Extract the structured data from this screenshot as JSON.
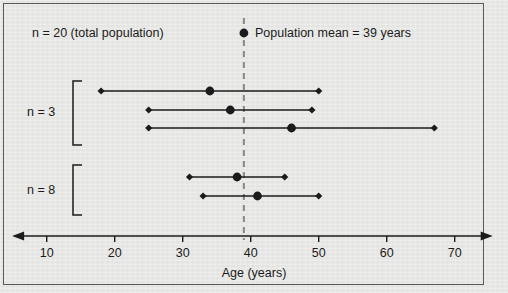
{
  "figure": {
    "background_color": "#e8e8e6",
    "border_color": "#5a5a58",
    "ink_color": "#1b1b1b",
    "mean_line_color": "#8c8c8c"
  },
  "legend": {
    "total_population_text": "n = 20 (total population)",
    "mean_marker_name": "population-mean-dot",
    "mean_text": "Population mean = 39 years"
  },
  "groups": [
    {
      "label": "n = 3",
      "bracket_top": 81,
      "bracket_bottom": 145
    },
    {
      "label": "n = 8",
      "bracket_top": 165,
      "bracket_bottom": 215
    }
  ],
  "chart_data": {
    "type": "scatter",
    "title": "",
    "subtitle": "",
    "xlabel": "Age (years)",
    "ylabel": "",
    "xlim": [
      5.5,
      75
    ],
    "xticks": [
      10,
      20,
      30,
      40,
      50,
      60,
      70
    ],
    "xticklabels": [
      "10",
      "20",
      "30",
      "40",
      "50",
      "60",
      "70"
    ],
    "grid": false,
    "legend_position": "top-right",
    "annotations": [
      "n = 20 (total population)",
      "Population mean = 39 years",
      "n = 3",
      "n = 8"
    ],
    "reference_lines": [
      {
        "name": "population-mean",
        "orientation": "vertical",
        "value": 39,
        "style": "dashed",
        "label": "Population mean = 39 years"
      }
    ],
    "series": [
      {
        "name": "sample-ranges",
        "description": "Horizontal range bars with sample minimum, sample mean, and sample maximum ages",
        "points": [
          {
            "row": 1,
            "group": "n = 3",
            "min": 18,
            "mean": 34,
            "max": 50
          },
          {
            "row": 2,
            "group": "n = 3",
            "min": 25,
            "mean": 37,
            "max": 49
          },
          {
            "row": 3,
            "group": "n = 3",
            "min": 25,
            "mean": 46,
            "max": 67
          },
          {
            "row": 4,
            "group": "n = 8",
            "min": 31,
            "mean": 38,
            "max": 45
          },
          {
            "row": 5,
            "group": "n = 8",
            "min": 33,
            "mean": 41,
            "max": 50
          }
        ]
      }
    ]
  },
  "geometry": {
    "axis_y": 236,
    "x_at_age10": 46.7,
    "px_per_year": 6.8,
    "row_y": [
      91,
      110,
      128,
      177,
      196
    ],
    "bracket_x": 73
  }
}
